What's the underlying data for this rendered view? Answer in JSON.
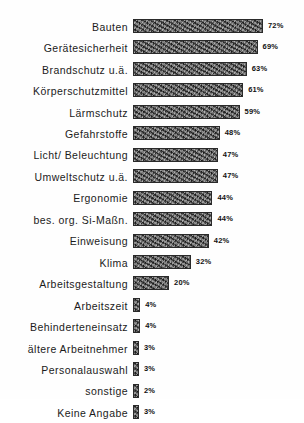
{
  "chart_data": {
    "type": "bar",
    "orientation": "horizontal",
    "title": "",
    "subtitle": "",
    "xlabel": "",
    "ylabel": "",
    "xlim": [
      0,
      72
    ],
    "grid": false,
    "legend": null,
    "value_suffix": "%",
    "categories": [
      "Bauten",
      "Gerätesicherheit",
      "Brandschutz u.ä.",
      "Körperschutzmittel",
      "Lärmschutz",
      "Gefahrstoffe",
      "Licht/ Beleuchtung",
      "Umweltschutz u.ä.",
      "Ergonomie",
      "bes. org. Si-Maßn.",
      "Einweisung",
      "Klima",
      "Arbeitsgestaltung",
      "Arbeitszeit",
      "Behinderteneinsatz",
      "ältere Arbeitnehmer",
      "Personalauswahl",
      "sonstige",
      "Keine Angabe"
    ],
    "values": [
      72,
      69,
      63,
      61,
      59,
      48,
      47,
      47,
      44,
      44,
      42,
      32,
      20,
      4,
      4,
      3,
      3,
      2,
      3
    ],
    "value_labels": [
      "72%",
      "69%",
      "63%",
      "61%",
      "59%",
      "48%",
      "47%",
      "47%",
      "44%",
      "44%",
      "42%",
      "32%",
      "20%",
      "4%",
      "4%",
      "3%",
      "3%",
      "2%",
      "3%"
    ],
    "bar_color": "#5a5a5a",
    "bar_border_color": "#2a2a2a",
    "background_color": "#fefefe",
    "text_color": "#1b1b1b"
  }
}
